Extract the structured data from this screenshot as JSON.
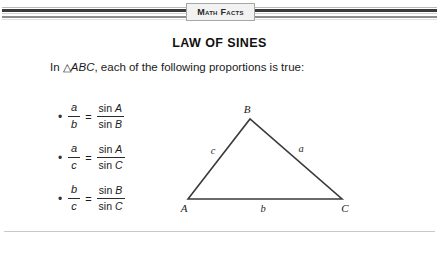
{
  "banner": {
    "label": "Math Facts"
  },
  "title": "LAW OF SINES",
  "intro": {
    "prefix": "In ",
    "triangle_symbol": "△",
    "triangle_name": "ABC",
    "suffix": ", each of the following proportions is true:"
  },
  "proportions": [
    {
      "bullet": "•",
      "left_num": "a",
      "left_den": "b",
      "equals": "=",
      "right_num_fn": "sin",
      "right_num_var": "A",
      "right_den_fn": "sin",
      "right_den_var": "B"
    },
    {
      "bullet": "•",
      "left_num": "a",
      "left_den": "c",
      "equals": "=",
      "right_num_fn": "sin",
      "right_num_var": "A",
      "right_den_fn": "sin",
      "right_den_var": "C"
    },
    {
      "bullet": "•",
      "left_num": "b",
      "left_den": "c",
      "equals": "=",
      "right_num_fn": "sin",
      "right_num_var": "B",
      "right_den_fn": "sin",
      "right_den_var": "C"
    }
  ],
  "diagram": {
    "vertices": {
      "A": "A",
      "B": "B",
      "C": "C"
    },
    "sides": {
      "a": "a",
      "b": "b",
      "c": "c"
    },
    "stroke_color": "#3a3a3a"
  }
}
